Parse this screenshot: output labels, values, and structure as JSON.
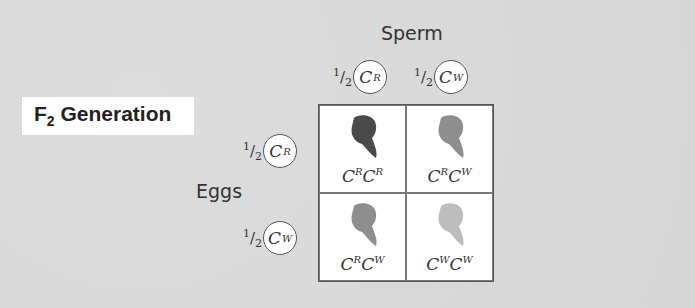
{
  "title": {
    "prefix": "F",
    "subscript": "2",
    "suffix": " Generation"
  },
  "sperm_label": "Sperm",
  "eggs_label": "Eggs",
  "fraction": {
    "num": "1",
    "den": "2"
  },
  "sperm_alleles": [
    {
      "base": "C",
      "sup": "R"
    },
    {
      "base": "C",
      "sup": "W"
    }
  ],
  "egg_alleles": [
    {
      "base": "C",
      "sup": "R"
    },
    {
      "base": "C",
      "sup": "W"
    }
  ],
  "punnett": [
    {
      "a": "R",
      "b": "R",
      "color": "#4a4a4a"
    },
    {
      "a": "R",
      "b": "W",
      "color": "#8e8e8e"
    },
    {
      "a": "R",
      "b": "W",
      "color": "#8e8e8e"
    },
    {
      "a": "W",
      "b": "W",
      "color": "#bdbdbd"
    }
  ]
}
